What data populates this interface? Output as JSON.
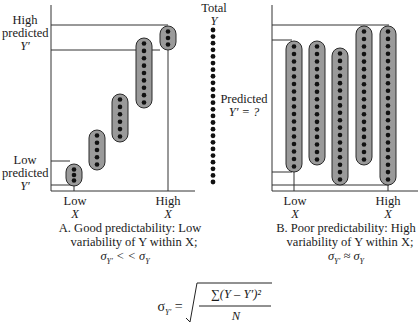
{
  "panel_a": {
    "high_predicted_label": [
      "High",
      "predicted",
      "Y′"
    ],
    "low_predicted_label": [
      "Low",
      "predicted",
      "Y′"
    ],
    "x_low_label": [
      "Low",
      "X"
    ],
    "x_high_label": [
      "High",
      "X"
    ],
    "caption_line1": "A. Good predictability: Low",
    "caption_line2": "variability of Y within X;",
    "caption_line3": "σY′ < < σY",
    "capsules": [
      {
        "cx": 74,
        "top": 164,
        "bottom": 186,
        "dots": 3
      },
      {
        "cx": 97,
        "top": 130,
        "bottom": 170,
        "dots": 5
      },
      {
        "cx": 120,
        "top": 94,
        "bottom": 142,
        "dots": 6
      },
      {
        "cx": 144,
        "top": 38,
        "bottom": 108,
        "dots": 9
      },
      {
        "cx": 168,
        "top": 26,
        "bottom": 50,
        "dots": 3
      }
    ]
  },
  "total_y": {
    "label_line1": "Total",
    "label_line2": "Y",
    "dots": 24
  },
  "panel_b": {
    "predicted_label_line1": "Predicted",
    "predicted_label_line2": "Y′ = ?",
    "x_low_label": [
      "Low",
      "X"
    ],
    "x_high_label": [
      "High",
      "X"
    ],
    "caption_line1": "B. Poor predictability: High",
    "caption_line2": "variability of Y within X;",
    "caption_line3": "σY′ ≈ σY",
    "capsules": [
      {
        "cx": 294,
        "top": 41,
        "bottom": 172,
        "dots": 17
      },
      {
        "cx": 317,
        "top": 41,
        "bottom": 165,
        "dots": 16
      },
      {
        "cx": 340,
        "top": 48,
        "bottom": 185,
        "dots": 18
      },
      {
        "cx": 364,
        "top": 26,
        "bottom": 165,
        "dots": 18
      },
      {
        "cx": 388,
        "top": 26,
        "bottom": 185,
        "dots": 21
      }
    ]
  },
  "formula": {
    "lhs": "σY′ =",
    "numerator": "∑(Y – Y′)²",
    "denominator": "N"
  },
  "colors": {
    "capsule_fill": "#9a9a9a",
    "capsule_stroke": "#2a2a2a",
    "dot": "#111111",
    "line": "#333333"
  }
}
